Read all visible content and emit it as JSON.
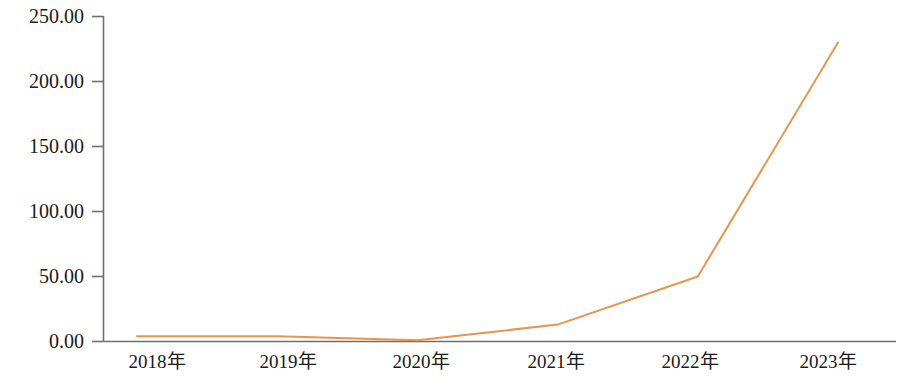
{
  "chart_data": {
    "type": "line",
    "title": "",
    "subtitle": "",
    "xlabel": "",
    "ylabel": "",
    "categories": [
      "2018年",
      "2019年",
      "2020年",
      "2021年",
      "2022年",
      "2023年"
    ],
    "series": [
      {
        "name": "",
        "values": [
          4,
          4,
          1,
          13,
          50,
          230
        ],
        "color": "#e5954f"
      }
    ],
    "ylim": [
      0,
      250
    ],
    "yticks": [
      0,
      50,
      100,
      150,
      200,
      250
    ],
    "ytick_labels": [
      "0.00",
      "50.00",
      "100.00",
      "150.00",
      "200.00",
      "250.00"
    ],
    "grid": false,
    "legend": "none",
    "axis_color": "#6e6e6e",
    "text_color": "#1a1a1a",
    "background": "#ffffff"
  }
}
